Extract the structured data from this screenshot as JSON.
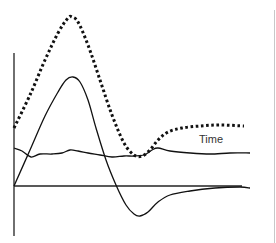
{
  "diagram": {
    "axis_label": "Time",
    "colors": {
      "line": "#111111",
      "axis": "#222222",
      "label": "#333333",
      "border": "#c8c8c8"
    },
    "axes": {
      "y_axis": {
        "x": 14,
        "y_top": 53,
        "y_bottom": 236
      },
      "x_axis": {
        "y": 186,
        "x_start": 14,
        "x_end": 242
      }
    },
    "curves": [
      {
        "name": "dotted-response",
        "style": "dotted",
        "points": [
          [
            14,
            128
          ],
          [
            30,
            95
          ],
          [
            45,
            60
          ],
          [
            58,
            33
          ],
          [
            68,
            18
          ],
          [
            72,
            17
          ],
          [
            78,
            22
          ],
          [
            88,
            45
          ],
          [
            100,
            80
          ],
          [
            112,
            115
          ],
          [
            124,
            143
          ],
          [
            134,
            155
          ],
          [
            142,
            156
          ],
          [
            150,
            150
          ],
          [
            158,
            140
          ],
          [
            168,
            132
          ],
          [
            182,
            128
          ],
          [
            200,
            126
          ],
          [
            220,
            125
          ],
          [
            244,
            126
          ]
        ]
      },
      {
        "name": "solid-peak-response",
        "style": "solid",
        "points": [
          [
            14,
            186
          ],
          [
            30,
            150
          ],
          [
            45,
            116
          ],
          [
            58,
            92
          ],
          [
            66,
            80
          ],
          [
            73,
            77
          ],
          [
            80,
            82
          ],
          [
            88,
            100
          ],
          [
            96,
            128
          ],
          [
            106,
            160
          ],
          [
            116,
            185
          ],
          [
            126,
            205
          ],
          [
            134,
            214
          ],
          [
            140,
            216
          ],
          [
            148,
            212
          ],
          [
            158,
            202
          ],
          [
            170,
            195
          ],
          [
            190,
            191
          ],
          [
            215,
            188
          ],
          [
            240,
            187
          ],
          [
            250,
            188
          ]
        ]
      },
      {
        "name": "solid-baseline",
        "style": "solid",
        "points": [
          [
            14,
            148
          ],
          [
            22,
            151
          ],
          [
            31,
            157
          ],
          [
            40,
            154
          ],
          [
            52,
            154
          ],
          [
            62,
            153
          ],
          [
            70,
            150
          ],
          [
            78,
            151
          ],
          [
            88,
            153
          ],
          [
            100,
            155
          ],
          [
            112,
            157
          ],
          [
            124,
            156
          ],
          [
            134,
            156
          ],
          [
            144,
            155
          ],
          [
            152,
            150
          ],
          [
            158,
            148
          ],
          [
            170,
            151
          ],
          [
            190,
            153
          ],
          [
            210,
            154
          ],
          [
            230,
            153
          ],
          [
            250,
            153
          ]
        ]
      }
    ]
  }
}
